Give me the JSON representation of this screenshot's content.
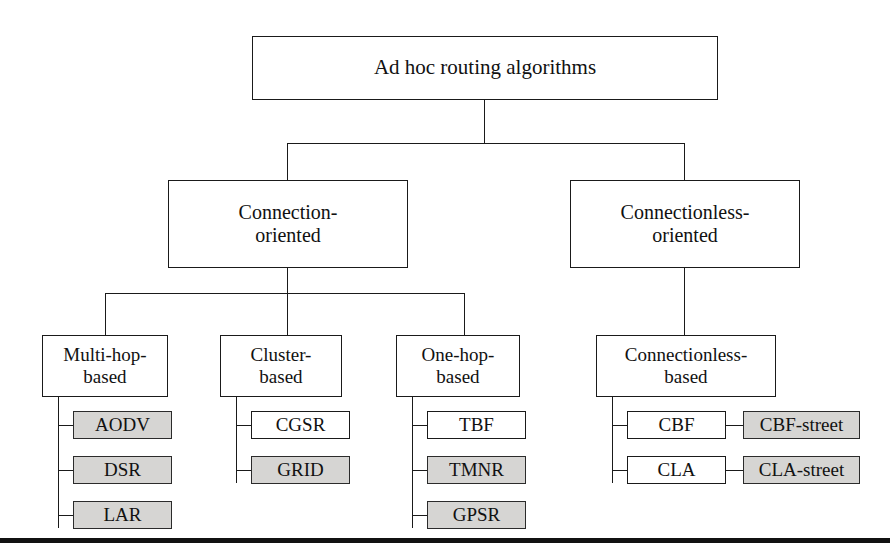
{
  "diagram": {
    "root": {
      "label": "Ad hoc routing algorithms"
    },
    "level2": [
      {
        "label": "Connection-\noriented"
      },
      {
        "label": "Connectionless-\noriented"
      }
    ],
    "level3": [
      {
        "label": "Multi-hop-\nbased"
      },
      {
        "label": "Cluster-\nbased"
      },
      {
        "label": "One-hop-\nbased"
      },
      {
        "label": "Connectionless-\nbased"
      }
    ],
    "leaves": {
      "multi_hop": [
        {
          "label": "AODV",
          "shaded": true
        },
        {
          "label": "DSR",
          "shaded": true
        },
        {
          "label": "LAR",
          "shaded": true
        }
      ],
      "cluster": [
        {
          "label": "CGSR",
          "shaded": false
        },
        {
          "label": "GRID",
          "shaded": true
        }
      ],
      "one_hop": [
        {
          "label": "TBF",
          "shaded": false
        },
        {
          "label": "TMNR",
          "shaded": true
        },
        {
          "label": "GPSR",
          "shaded": true
        }
      ],
      "connectionless": [
        {
          "label": "CBF",
          "shaded": false
        },
        {
          "label": "CLA",
          "shaded": false
        }
      ],
      "connectionless_street": [
        {
          "label": "CBF-street",
          "shaded": true
        },
        {
          "label": "CLA-street",
          "shaded": true
        }
      ]
    },
    "colors": {
      "shaded_fill": "#d6d5d3",
      "box_stroke": "#1a1a1a",
      "text": "#111111",
      "rule": "#111111",
      "background": "#ffffff"
    }
  }
}
